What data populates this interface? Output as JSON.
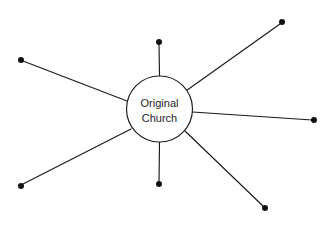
{
  "diagram": {
    "type": "hub-and-spoke",
    "background_color": "#ffffff",
    "line_color": "#1a1a1a",
    "node_color": "#111111",
    "text_color": "#262626",
    "hub": {
      "label_line1": "Original",
      "label_line2": "Church",
      "center_x": 159.5,
      "center_y": 109,
      "radius": 33,
      "fill": "#ffffff",
      "stroke": "#1a1a1a"
    },
    "spoke_count": 7,
    "spokes": [
      {
        "name": "spoke-top",
        "direction": "up",
        "endpoint_x": 159,
        "endpoint_y": 42,
        "dot_radius": 3,
        "line_start_x": 159.5,
        "line_start_y": 76,
        "line_end_x": 159,
        "line_end_y": 43
      },
      {
        "name": "spoke-upper-right",
        "direction": "upper-right",
        "endpoint_x": 282,
        "endpoint_y": 22,
        "dot_radius": 3,
        "line_start_x": 186.5,
        "line_start_y": 90.5,
        "line_end_x": 280,
        "line_end_y": 24
      },
      {
        "name": "spoke-right",
        "direction": "right",
        "endpoint_x": 314,
        "endpoint_y": 120,
        "dot_radius": 3,
        "line_start_x": 192.5,
        "line_start_y": 112,
        "line_end_x": 312,
        "line_end_y": 120
      },
      {
        "name": "spoke-lower-right",
        "direction": "lower-right",
        "endpoint_x": 265,
        "endpoint_y": 208,
        "dot_radius": 3,
        "line_start_x": 185,
        "line_start_y": 131,
        "line_end_x": 263,
        "line_end_y": 206
      },
      {
        "name": "spoke-bottom",
        "direction": "down",
        "endpoint_x": 159,
        "endpoint_y": 184,
        "dot_radius": 3,
        "line_start_x": 159.5,
        "line_start_y": 142,
        "line_end_x": 159,
        "line_end_y": 183
      },
      {
        "name": "spoke-lower-left",
        "direction": "lower-left",
        "endpoint_x": 21,
        "endpoint_y": 186,
        "dot_radius": 3,
        "line_start_x": 131,
        "line_start_y": 129,
        "line_end_x": 23,
        "line_end_y": 184
      },
      {
        "name": "spoke-upper-left",
        "direction": "upper-left",
        "endpoint_x": 21,
        "endpoint_y": 60,
        "dot_radius": 3,
        "line_start_x": 127,
        "line_start_y": 101,
        "line_end_x": 23,
        "line_end_y": 61
      }
    ]
  }
}
